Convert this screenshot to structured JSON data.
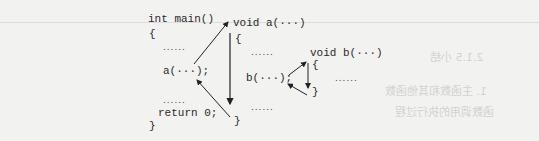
{
  "diagram": {
    "main_function": {
      "header": "int main()",
      "open_brace": "{",
      "ellipsis_1": "......",
      "call": "a(···);",
      "ellipsis_2": "......",
      "return": "return 0;",
      "close_brace": "}"
    },
    "function_a": {
      "header": "void a(···)",
      "open_brace": "{",
      "ellipsis_1": "......",
      "call": "b(···);",
      "ellipsis_2": "......",
      "close_brace": "}"
    },
    "function_b": {
      "header": "void b(···)",
      "open_brace": "{",
      "ellipsis": "......",
      "close_brace": "}"
    },
    "arrows": [
      {
        "from": "main.call a(...)",
        "to": "void a(...)",
        "meaning": "call"
      },
      {
        "from": "a.open_brace",
        "to": "a.close_brace",
        "meaning": "execute body"
      },
      {
        "from": "a.close_brace",
        "to": "main.call a(...)",
        "meaning": "return"
      },
      {
        "from": "a.call b(...)",
        "to": "b.open_brace",
        "meaning": "call"
      },
      {
        "from": "b.open_brace",
        "to": "b.close_brace",
        "meaning": "execute body"
      },
      {
        "from": "b.close_brace",
        "to": "a.call b(...)",
        "meaning": "return"
      }
    ]
  },
  "background": {
    "bleed_through_lines": [
      "2.1.5 小结",
      "1. 主函数和其他函数",
      "函数调用的执行过程"
    ]
  }
}
